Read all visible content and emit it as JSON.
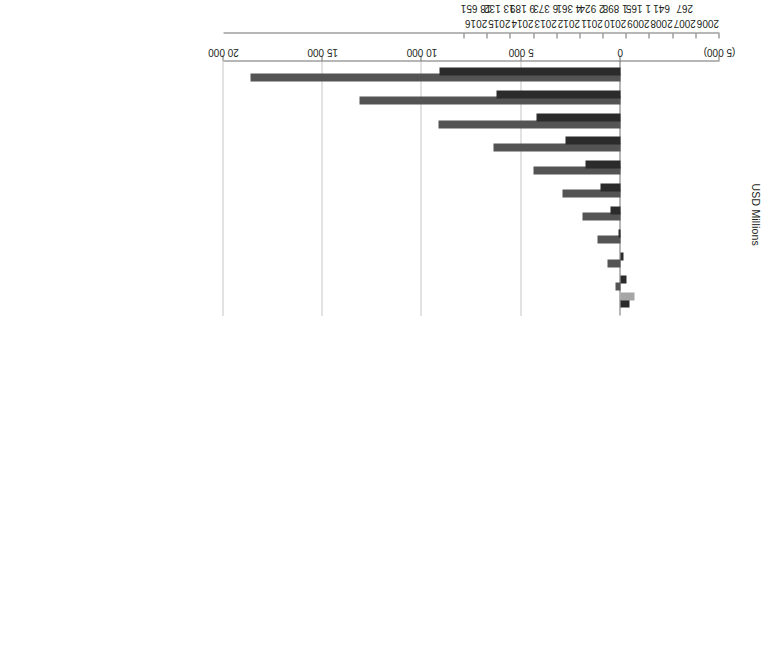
{
  "chart_data": {
    "type": "bar",
    "orientation": "horizontal",
    "title": "",
    "xlabel": "USD Millions",
    "ylabel": "",
    "categories": [
      "2006",
      "2007",
      "2008",
      "2009",
      "2010",
      "2011",
      "2012",
      "2013",
      "2014",
      "2015",
      "2016"
    ],
    "series": [
      {
        "name": "Revenue",
        "color": "#545454",
        "values": [
          null,
          267,
          641,
          1165,
          1898,
          2924,
          4361,
          6373,
          9189,
          13132,
          18651
        ],
        "labels": [
          "",
          "267",
          "641",
          "1 165",
          "1 898",
          "2 924",
          "4 361",
          "6 373",
          "9 189",
          "13 132",
          "18 651"
        ]
      },
      {
        "name": "NOPAT",
        "superscript": "b",
        "color": "#2b2b2b",
        "values": [
          -447,
          -322,
          -141,
          116,
          482,
          1000,
          1730,
          2759,
          4204,
          6234,
          9100
        ],
        "labels": [
          "(447)",
          "(322)",
          "(141)",
          "116",
          "482",
          "1 000",
          "1 730",
          "2 759",
          "4 204",
          "6 234",
          "9 100"
        ]
      },
      {
        "name": "Capital Investment",
        "color": "#a6a6a6",
        "values": [
          -700,
          null,
          null,
          null,
          null,
          null,
          null,
          null,
          null,
          null,
          null
        ],
        "labels": [
          "(700)",
          "",
          "",
          "",
          "",
          "",
          "",
          "",
          "",
          "",
          ""
        ]
      }
    ],
    "xlim": [
      -5000,
      20000
    ],
    "xticks": [
      -5000,
      0,
      5000,
      10000,
      15000,
      20000
    ],
    "xticklabels": [
      "(5 000)",
      "0",
      "5 000",
      "10 000",
      "15 000",
      "20 000"
    ],
    "grid": true,
    "gridlines_at": [
      5000,
      10000,
      15000,
      20000
    ],
    "legend_position": "bottom-left",
    "axis_title": "USD Millions"
  },
  "legend": {
    "items": [
      {
        "label": "Revenue",
        "sup": ""
      },
      {
        "label": "NOPAT",
        "sup": "b"
      },
      {
        "label": "Capital Investment",
        "sup": ""
      }
    ]
  },
  "footer": {
    "notes_label": "Notes:"
  },
  "axis": {
    "y_title": "USD Millions"
  }
}
